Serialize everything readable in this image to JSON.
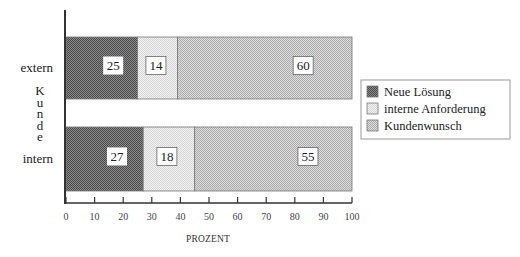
{
  "chart_data": {
    "type": "bar",
    "orientation": "horizontal",
    "stacked": true,
    "title": "",
    "xlabel": "PROZENT",
    "ylabel": "Kunde",
    "xlim": [
      0,
      100
    ],
    "x_ticks": [
      0,
      10,
      20,
      30,
      40,
      50,
      60,
      70,
      80,
      90,
      100
    ],
    "categories": [
      "extern",
      "intern"
    ],
    "series": [
      {
        "name": "Neue Lösung",
        "values": [
          25,
          27
        ],
        "color": "#6e6e6e"
      },
      {
        "name": "interne Anforderung",
        "values": [
          14,
          18
        ],
        "color": "#e4e4e4"
      },
      {
        "name": "Kundenwunsch",
        "values": [
          60,
          55
        ],
        "color": "#c4c4c4"
      }
    ],
    "grid": false,
    "legend_position": "right",
    "data_labels": true
  },
  "labels": {
    "ylabel_letters": [
      "K",
      "u",
      "n",
      "d",
      "e"
    ],
    "xlabel": "PROZENT"
  }
}
